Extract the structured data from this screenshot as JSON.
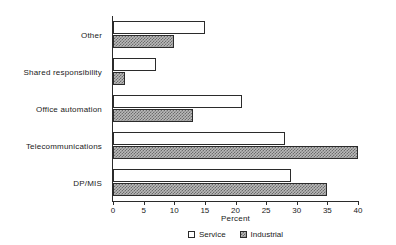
{
  "chart_data": {
    "type": "bar",
    "orientation": "horizontal",
    "title": "",
    "xlabel": "Percent",
    "ylabel": "",
    "xlim": [
      0,
      40
    ],
    "xticks": [
      0,
      5,
      10,
      15,
      20,
      25,
      30,
      35,
      40
    ],
    "grid": false,
    "legend_position": "bottom",
    "categories": [
      "Other",
      "Shared responsibility",
      "Office automation",
      "Telecommunications",
      "DP/MIS"
    ],
    "series": [
      {
        "name": "Service",
        "values": [
          15,
          7,
          21,
          28,
          29
        ],
        "fill": "#ffffff",
        "pattern": "solid-white",
        "edge": "#2b2b2b"
      },
      {
        "name": "Industrial",
        "values": [
          10,
          2,
          13,
          40,
          35
        ],
        "fill": "#b9b9b9",
        "pattern": "crosshatch",
        "edge": "#2b2b2b"
      }
    ]
  },
  "legend": {
    "items": [
      {
        "label": "Service",
        "swatch": "legend-swatch-service"
      },
      {
        "label": "Industrial",
        "swatch": "legend-swatch-industrial"
      }
    ]
  },
  "axis": {
    "x_title": "Percent",
    "tick_labels": [
      "0",
      "5",
      "10",
      "15",
      "20",
      "25",
      "30",
      "35",
      "40"
    ]
  },
  "colors": {
    "axis": "#2b2b2b",
    "text": "#1a1a1a",
    "background": "#ffffff",
    "industrial_fill": "#b9b9b9",
    "service_fill": "#ffffff"
  }
}
